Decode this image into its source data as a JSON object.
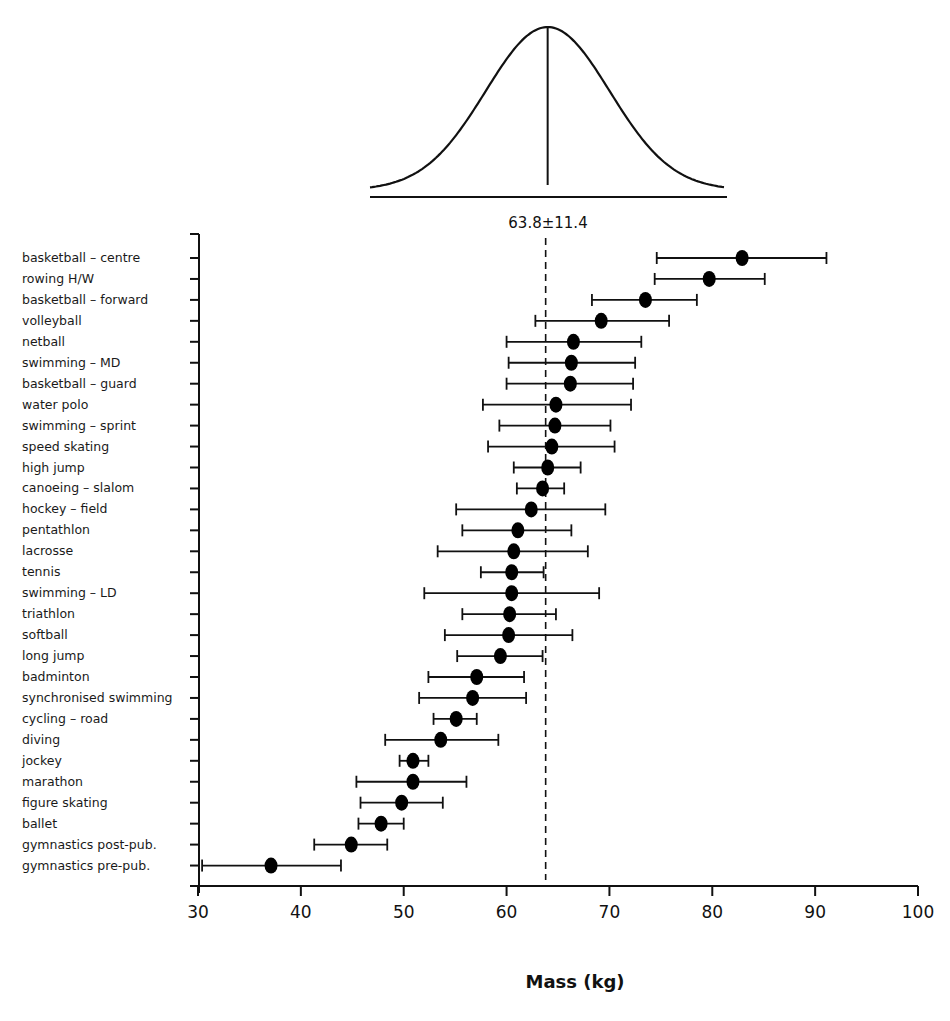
{
  "chart_data": {
    "type": "scatter",
    "subtype": "dot-with-error-bars (mean ± SD), horizontal",
    "title": "",
    "xlabel": "Mass (kg)",
    "ylabel": "",
    "xlim": [
      30,
      100
    ],
    "xticks": [
      30,
      40,
      50,
      60,
      70,
      80,
      90,
      100
    ],
    "grid": false,
    "legend": null,
    "reference": {
      "label": "63.8±11.4",
      "mean": 63.8,
      "sd": 11.4,
      "style": "dashed vertical line with normal distribution curve above"
    },
    "categories": [
      "basketball – centre",
      "rowing H/W",
      "basketball – forward",
      "volleyball",
      "netball",
      "swimming – MD",
      "basketball – guard",
      "water polo",
      "swimming – sprint",
      "speed skating",
      "high jump",
      "canoeing – slalom",
      "hockey – field",
      "pentathlon",
      "lacrosse",
      "tennis",
      "swimming – LD",
      "triathlon",
      "softball",
      "long jump",
      "badminton",
      "synchronised swimming",
      "cycling – road",
      "diving",
      "jockey",
      "marathon",
      "figure skating",
      "ballet",
      "gymnastics post-pub.",
      "gymnastics pre-pub."
    ],
    "series": [
      {
        "name": "mean",
        "values": [
          82.9,
          79.7,
          73.5,
          69.2,
          66.5,
          66.3,
          66.2,
          64.8,
          64.7,
          64.4,
          64.0,
          63.5,
          62.4,
          61.1,
          60.7,
          60.5,
          60.5,
          60.3,
          60.2,
          59.4,
          57.1,
          56.7,
          55.1,
          53.6,
          50.9,
          50.9,
          49.8,
          47.8,
          44.9,
          37.1
        ]
      },
      {
        "name": "lower",
        "values": [
          74.6,
          74.4,
          68.3,
          62.8,
          60.0,
          60.2,
          60.0,
          57.7,
          59.3,
          58.2,
          60.7,
          61.0,
          55.1,
          55.7,
          53.3,
          57.5,
          52.0,
          55.7,
          54.0,
          55.2,
          52.4,
          51.5,
          52.9,
          48.2,
          49.6,
          45.4,
          45.8,
          45.6,
          41.3,
          30.4
        ]
      },
      {
        "name": "upper",
        "values": [
          91.1,
          85.1,
          78.5,
          75.8,
          73.1,
          72.5,
          72.3,
          72.1,
          70.1,
          70.5,
          67.2,
          65.6,
          69.6,
          66.3,
          67.9,
          63.6,
          69.0,
          64.8,
          66.4,
          63.5,
          61.7,
          61.9,
          57.1,
          59.2,
          52.4,
          56.1,
          53.8,
          50.0,
          48.4,
          43.9
        ]
      }
    ]
  }
}
